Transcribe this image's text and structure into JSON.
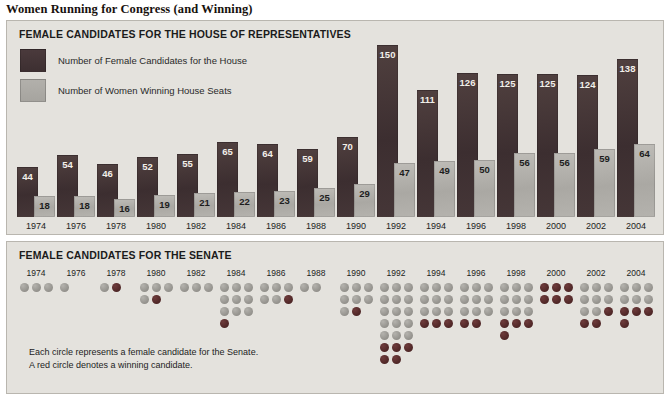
{
  "title": "Women Running for Congress (and Winning)",
  "house": {
    "panel_title": "FEMALE CANDIDATES FOR THE HOUSE OF REPRESENTATIVES",
    "legend": [
      {
        "key": "candidates",
        "label": "Number of Female Candidates for the House",
        "swatch": "dark-swatch",
        "color": "#3d2f31"
      },
      {
        "key": "winners",
        "label": "Number of Women Winning House Seats",
        "swatch": "light-swatch",
        "color": "#a6a49f"
      }
    ]
  },
  "senate": {
    "panel_title": "FEMALE CANDIDATES FOR THE SENATE",
    "footnote_line1": "Each circle represents a female candidate for the Senate.",
    "footnote_line2": "A red circle denotes a winning candidate."
  },
  "colors": {
    "panel_background": "#e4e2dd",
    "panel_border": "#b9b6af",
    "bar_candidates": "#3d2f31",
    "bar_winners": "#a6a49f",
    "dot_losing": "#93918c",
    "dot_winning": "#4e2626",
    "page_background": "#ffffff"
  },
  "chart_data": [
    {
      "type": "bar",
      "title": "FEMALE CANDIDATES FOR THE HOUSE OF REPRESENTATIVES",
      "xlabel": "",
      "ylabel": "",
      "ylim": [
        0,
        150
      ],
      "grid": false,
      "legend_position": "top-left",
      "categories": [
        "1974",
        "1976",
        "1978",
        "1980",
        "1982",
        "1984",
        "1986",
        "1988",
        "1990",
        "1992",
        "1994",
        "1996",
        "1998",
        "2000",
        "2002",
        "2004"
      ],
      "series": [
        {
          "name": "Number of Female Candidates for the House",
          "values": [
            44,
            54,
            46,
            52,
            55,
            65,
            64,
            59,
            70,
            150,
            111,
            126,
            125,
            125,
            124,
            138
          ]
        },
        {
          "name": "Number of Women Winning House Seats",
          "values": [
            18,
            18,
            16,
            19,
            21,
            22,
            23,
            25,
            29,
            47,
            49,
            50,
            56,
            56,
            59,
            64
          ]
        }
      ]
    },
    {
      "type": "unit-dot",
      "title": "FEMALE CANDIDATES FOR THE SENATE",
      "unit": "1 circle = 1 female Senate candidate",
      "dots_per_row": 3,
      "categories": [
        "1974",
        "1976",
        "1978",
        "1980",
        "1982",
        "1984",
        "1986",
        "1988",
        "1990",
        "1992",
        "1994",
        "1996",
        "1998",
        "2000",
        "2002",
        "2004"
      ],
      "series": [
        {
          "name": "Losing candidates",
          "values": [
            3,
            1,
            1,
            4,
            3,
            9,
            5,
            2,
            7,
            15,
            9,
            9,
            9,
            0,
            8,
            6
          ]
        },
        {
          "name": "Winning candidates",
          "values": [
            0,
            0,
            1,
            1,
            0,
            1,
            1,
            0,
            1,
            5,
            3,
            2,
            4,
            6,
            3,
            4
          ]
        }
      ],
      "totals": [
        3,
        1,
        2,
        5,
        3,
        10,
        6,
        2,
        8,
        20,
        12,
        11,
        13,
        6,
        11,
        10
      ]
    }
  ]
}
